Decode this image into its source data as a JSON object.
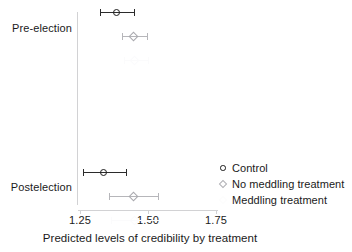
{
  "chart_data": {
    "type": "scatter",
    "title": "",
    "xlabel": "Predicted levels of credibility by treatment",
    "ylabel": "",
    "xlim": [
      1.18,
      1.8
    ],
    "xticks": [
      1.25,
      1.5,
      1.75
    ],
    "xticklabels": [
      "1.25",
      "1.50",
      "1.75"
    ],
    "ylim": [
      0,
      2
    ],
    "categories": [
      "Pre-election",
      "Postelection"
    ],
    "grid": false,
    "legend_position": "center-right",
    "orientation": "horizontal-error-bars",
    "series": [
      {
        "name": "Control",
        "marker": "circle",
        "color": "#1c1c1c",
        "points": [
          {
            "group": "Pre-election",
            "value": 1.385,
            "ci_low": 1.325,
            "ci_high": 1.447
          },
          {
            "group": "Postelection",
            "value": 1.335,
            "ci_low": 1.262,
            "ci_high": 1.42
          }
        ]
      },
      {
        "name": "No meddling treatment",
        "marker": "diamond",
        "color": "#aeaeb3",
        "points": [
          {
            "group": "Pre-election",
            "value": 1.447,
            "ci_low": 1.405,
            "ci_high": 1.495
          },
          {
            "group": "Postelection",
            "value": 1.447,
            "ci_low": 1.358,
            "ci_high": 1.537
          }
        ]
      },
      {
        "name": "Meddling treatment",
        "marker": "diamond",
        "color": "#fbfbfc",
        "points": [
          {
            "group": "Pre-election",
            "value": 1.452,
            "ci_low": 1.41,
            "ci_high": 1.5
          },
          {
            "group": "Postelection",
            "value": 1.452,
            "ci_low": 1.365,
            "ci_high": 1.54
          }
        ]
      }
    ]
  },
  "axis": {
    "y_labels": [
      "Pre-election",
      "Postelection"
    ],
    "x_tick_labels": [
      "1.25",
      "1.50",
      "1.75"
    ],
    "x_title": "Predicted levels of credibility by treatment"
  },
  "legend": {
    "entries": [
      {
        "label": "Control",
        "key": "circle-marker-icon"
      },
      {
        "label": "No meddling treatment",
        "key": "diamond-marker-icon"
      },
      {
        "label": "Meddling treatment",
        "key": "diamond-marker-faint-icon"
      }
    ]
  },
  "colors": {
    "control": "#1c1c1c",
    "no_meddling": "#aeaeb3",
    "meddling": "#fbfbfc",
    "axis": "#d2d2d4",
    "text": "#1a1a1a"
  }
}
